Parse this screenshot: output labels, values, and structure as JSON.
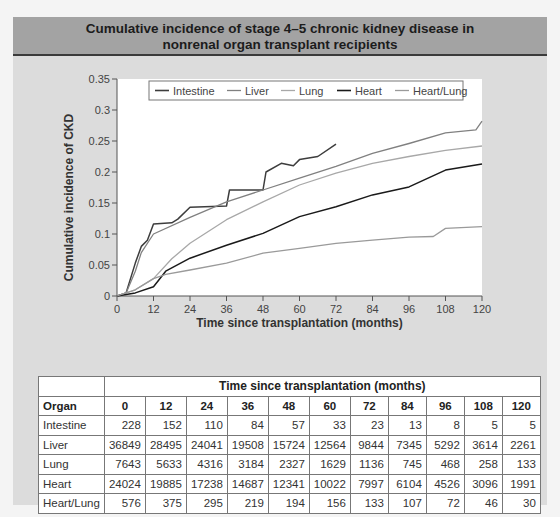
{
  "title": {
    "line1": "Cumulative incidence of stage 4–5 chronic kidney disease in",
    "line2": "nonrenal organ transplant recipients"
  },
  "colors": {
    "panel_bg": "#dcdcdc",
    "title_bg": "#a3a3a3",
    "plot_bg": "#ffffff",
    "Intestine": "#3d3d3d",
    "Liver": "#808080",
    "Lung": "#a8a8a8",
    "Heart": "#1a1a1a",
    "Heart/Lung": "#9a9a9a"
  },
  "chart_data": {
    "type": "line",
    "title": "Cumulative incidence of stage 4–5 chronic kidney disease in nonrenal organ transplant recipients",
    "xlabel": "Time since transplantation (months)",
    "ylabel": "Cumulative incidence of CKD",
    "xlim": [
      0,
      120
    ],
    "ylim": [
      0,
      0.35
    ],
    "xticks": [
      0,
      12,
      24,
      36,
      48,
      60,
      72,
      84,
      96,
      108,
      120
    ],
    "yticks": [
      0,
      0.05,
      0.1,
      0.15,
      0.2,
      0.25,
      0.3,
      0.35
    ],
    "ytick_labels": [
      "0",
      "0.05",
      "0.1",
      "0.15",
      "0.2",
      "0.25",
      "0.3",
      "0.35"
    ],
    "grid": false,
    "legend_position": "top-inside",
    "series": [
      {
        "name": "Intestine",
        "x": [
          0,
          3,
          6,
          8,
          10,
          12,
          18,
          20,
          24,
          36,
          37,
          48,
          49,
          54,
          58,
          60,
          66,
          72
        ],
        "values": [
          0,
          0.005,
          0.053,
          0.08,
          0.09,
          0.116,
          0.118,
          0.124,
          0.143,
          0.145,
          0.171,
          0.171,
          0.2,
          0.214,
          0.21,
          0.22,
          0.225,
          0.245
        ]
      },
      {
        "name": "Liver",
        "x": [
          0,
          3,
          6,
          8,
          12,
          24,
          36,
          48,
          60,
          72,
          84,
          96,
          108,
          118,
          120
        ],
        "values": [
          0,
          0.005,
          0.04,
          0.07,
          0.1,
          0.127,
          0.152,
          0.171,
          0.19,
          0.209,
          0.23,
          0.246,
          0.263,
          0.268,
          0.282
        ]
      },
      {
        "name": "Lung",
        "x": [
          0,
          6,
          12,
          18,
          24,
          36,
          48,
          60,
          72,
          84,
          96,
          108,
          120
        ],
        "values": [
          0,
          0.01,
          0.028,
          0.06,
          0.085,
          0.123,
          0.152,
          0.179,
          0.198,
          0.214,
          0.225,
          0.235,
          0.242
        ]
      },
      {
        "name": "Heart",
        "x": [
          0,
          6,
          12,
          16,
          24,
          36,
          48,
          60,
          72,
          84,
          96,
          108,
          120
        ],
        "values": [
          0,
          0.005,
          0.015,
          0.04,
          0.061,
          0.082,
          0.101,
          0.128,
          0.144,
          0.163,
          0.176,
          0.203,
          0.213
        ]
      },
      {
        "name": "Heart/Lung",
        "x": [
          0,
          6,
          12,
          16,
          24,
          36,
          48,
          60,
          72,
          84,
          96,
          104,
          108,
          120
        ],
        "values": [
          0,
          0.01,
          0.028,
          0.035,
          0.042,
          0.053,
          0.069,
          0.077,
          0.085,
          0.09,
          0.095,
          0.096,
          0.109,
          0.112
        ]
      }
    ]
  },
  "table": {
    "group_header": "Time since transplantation (months)",
    "organ_header": "Organ",
    "columns": [
      "0",
      "12",
      "24",
      "36",
      "48",
      "60",
      "72",
      "84",
      "96",
      "108",
      "120"
    ],
    "rows": [
      {
        "organ": "Intestine",
        "values": [
          "228",
          "152",
          "110",
          "84",
          "57",
          "33",
          "23",
          "13",
          "8",
          "5",
          "5"
        ]
      },
      {
        "organ": "Liver",
        "values": [
          "36849",
          "28495",
          "24041",
          "19508",
          "15724",
          "12564",
          "9844",
          "7345",
          "5292",
          "3614",
          "2261"
        ]
      },
      {
        "organ": "Lung",
        "values": [
          "7643",
          "5633",
          "4316",
          "3184",
          "2327",
          "1629",
          "1136",
          "745",
          "468",
          "258",
          "133"
        ]
      },
      {
        "organ": "Heart",
        "values": [
          "24024",
          "19885",
          "17238",
          "14687",
          "12341",
          "10022",
          "7997",
          "6104",
          "4526",
          "3096",
          "1991"
        ]
      },
      {
        "organ": "Heart/Lung",
        "values": [
          "576",
          "375",
          "295",
          "219",
          "194",
          "156",
          "133",
          "107",
          "72",
          "46",
          "30"
        ]
      }
    ]
  }
}
